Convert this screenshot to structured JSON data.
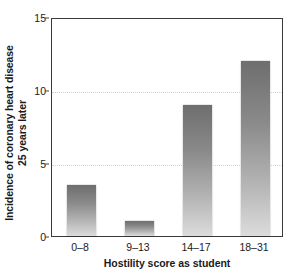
{
  "chart_data": {
    "type": "bar",
    "title": "",
    "categories": [
      "0–8",
      "9–13",
      "14–17",
      "18–31"
    ],
    "values": [
      3.5,
      1.0,
      9.0,
      12.0
    ],
    "series": [
      {
        "name": "Incidence of coronary heart disease 25 years later",
        "values": [
          3.5,
          1.0,
          9.0,
          12.0
        ]
      }
    ],
    "xlabel": "Hostility score as student",
    "ylabel": "Incidence of coronary heart disease 25 years later",
    "ylabel_line1": "Incidence of coronary heart disease",
    "ylabel_line2": "25 years later",
    "ylim": [
      0,
      15
    ],
    "yticks": [
      0,
      5,
      10,
      15
    ],
    "ytick_labels": [
      "0",
      "5",
      "10",
      "15"
    ],
    "gridlines": {
      "y": [
        5,
        10
      ],
      "style": "dotted",
      "color": "#d2d2d2"
    },
    "legend": null,
    "legend_position": "none",
    "bar_fill": {
      "type": "vertical-gradient",
      "top_color": "#6e6e6e",
      "bottom_color": "#dcdcdc"
    },
    "axis_color": "#3a3a3a",
    "text_color": "#1a1a1a",
    "background": "#ffffff"
  }
}
